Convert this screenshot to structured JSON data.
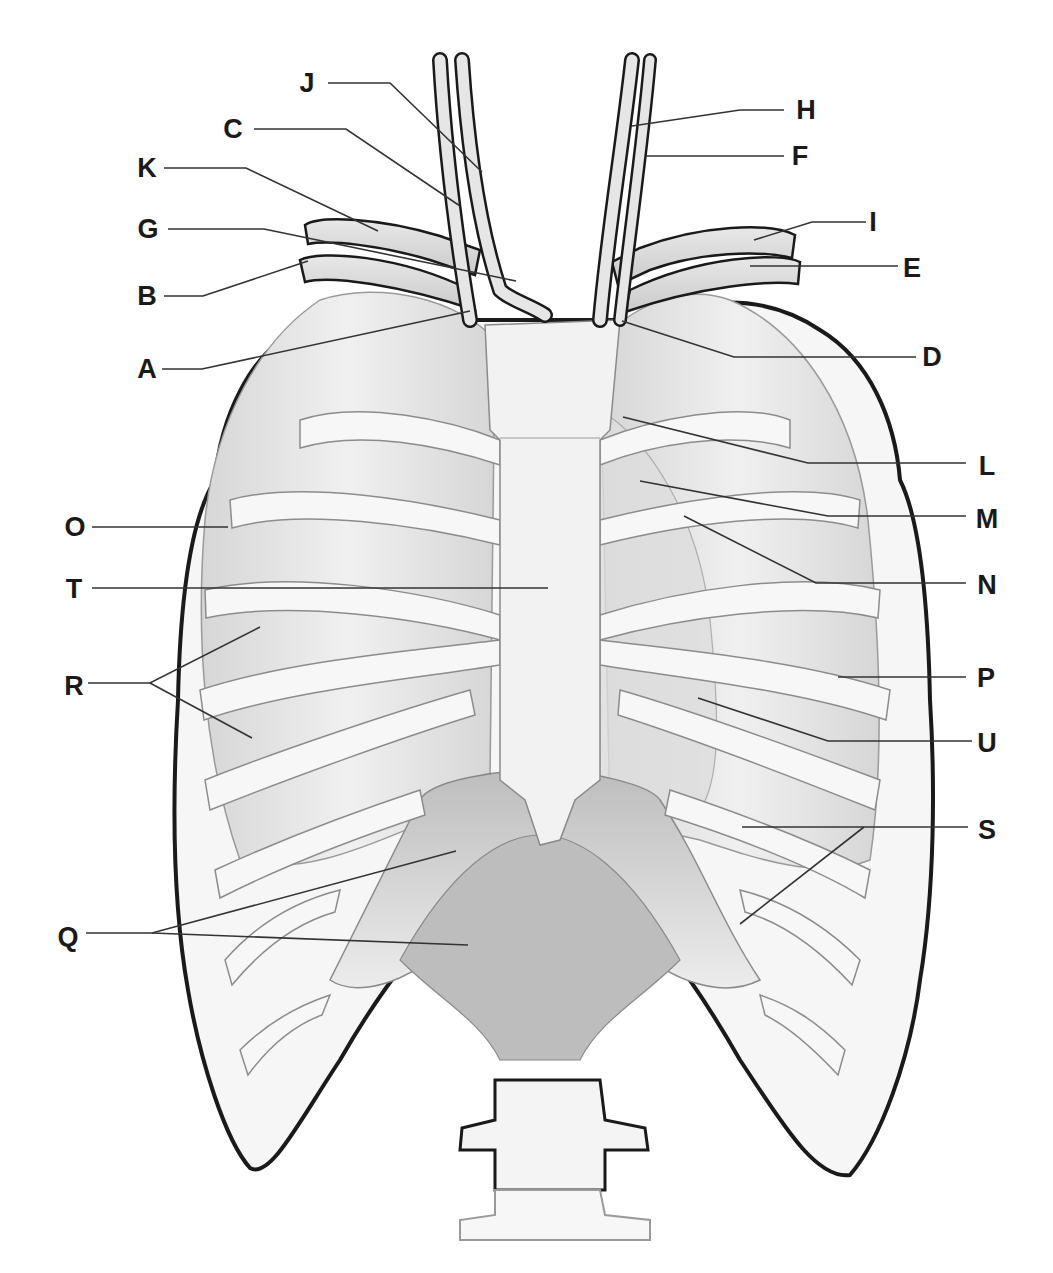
{
  "figure": {
    "colors": {
      "outline": "#1a1a1a",
      "bone": "#f4f4f4",
      "lung": "#e4e4e4",
      "muscle": "#cfcfcf",
      "leader": "#333333"
    }
  },
  "labels": [
    {
      "id": "J",
      "text": "J",
      "x": 307,
      "y": 83,
      "leader": [
        [
          328,
          83
        ],
        [
          390,
          83
        ],
        [
          482,
          172
        ]
      ]
    },
    {
      "id": "C",
      "text": "C",
      "x": 233,
      "y": 129,
      "leader": [
        [
          254,
          129
        ],
        [
          346,
          129
        ],
        [
          460,
          206
        ]
      ]
    },
    {
      "id": "K",
      "text": "K",
      "x": 147,
      "y": 168,
      "leader": [
        [
          164,
          168
        ],
        [
          246,
          168
        ],
        [
          378,
          231
        ]
      ]
    },
    {
      "id": "G",
      "text": "G",
      "x": 148,
      "y": 229,
      "leader": [
        [
          168,
          229
        ],
        [
          264,
          229
        ],
        [
          516,
          281
        ]
      ]
    },
    {
      "id": "B",
      "text": "B",
      "x": 147,
      "y": 296,
      "leader": [
        [
          164,
          296
        ],
        [
          203,
          296
        ],
        [
          308,
          261
        ]
      ]
    },
    {
      "id": "A",
      "text": "A",
      "x": 147,
      "y": 369,
      "leader": [
        [
          162,
          369
        ],
        [
          202,
          369
        ],
        [
          470,
          311
        ]
      ]
    },
    {
      "id": "H",
      "text": "H",
      "x": 806,
      "y": 110,
      "leader": [
        [
          784,
          110
        ],
        [
          740,
          110
        ],
        [
          632,
          126
        ]
      ]
    },
    {
      "id": "F",
      "text": "F",
      "x": 800,
      "y": 156,
      "leader": [
        [
          784,
          156
        ],
        [
          646,
          156
        ]
      ]
    },
    {
      "id": "I",
      "text": "I",
      "x": 873,
      "y": 222,
      "leader": [
        [
          866,
          222
        ],
        [
          812,
          222
        ],
        [
          754,
          240
        ]
      ]
    },
    {
      "id": "E",
      "text": "E",
      "x": 912,
      "y": 268,
      "leader": [
        [
          898,
          266
        ],
        [
          750,
          266
        ]
      ]
    },
    {
      "id": "D",
      "text": "D",
      "x": 932,
      "y": 357,
      "leader": [
        [
          916,
          357
        ],
        [
          734,
          357
        ],
        [
          622,
          321
        ]
      ]
    },
    {
      "id": "L",
      "text": "L",
      "x": 987,
      "y": 466,
      "leader": [
        [
          966,
          463
        ],
        [
          808,
          463
        ],
        [
          623,
          417
        ]
      ]
    },
    {
      "id": "M",
      "text": "M",
      "x": 987,
      "y": 519,
      "leader": [
        [
          966,
          516
        ],
        [
          828,
          516
        ],
        [
          640,
          481
        ]
      ]
    },
    {
      "id": "N",
      "text": "N",
      "x": 987,
      "y": 585,
      "leader": [
        [
          966,
          583
        ],
        [
          816,
          583
        ],
        [
          684,
          516
        ]
      ]
    },
    {
      "id": "O",
      "text": "O",
      "x": 75,
      "y": 527,
      "leader": [
        [
          92,
          527
        ],
        [
          228,
          527
        ]
      ]
    },
    {
      "id": "T",
      "text": "T",
      "x": 74,
      "y": 589,
      "leader": [
        [
          92,
          588
        ],
        [
          548,
          588
        ]
      ]
    },
    {
      "id": "R",
      "text": "R",
      "x": 74,
      "y": 686,
      "leader": [
        [
          88,
          683
        ],
        [
          150,
          683
        ],
        [
          260,
          627
        ]
      ],
      "leader2": [
        [
          150,
          683
        ],
        [
          252,
          738
        ]
      ]
    },
    {
      "id": "P",
      "text": "P",
      "x": 986,
      "y": 678,
      "leader": [
        [
          966,
          677
        ],
        [
          838,
          677
        ]
      ]
    },
    {
      "id": "U",
      "text": "U",
      "x": 987,
      "y": 743,
      "leader": [
        [
          972,
          741
        ],
        [
          828,
          741
        ],
        [
          698,
          698
        ]
      ]
    },
    {
      "id": "S",
      "text": "S",
      "x": 987,
      "y": 830,
      "leader": [
        [
          968,
          827
        ],
        [
          742,
          827
        ]
      ],
      "leader2": [
        [
          864,
          827
        ],
        [
          740,
          924
        ]
      ]
    },
    {
      "id": "Q",
      "text": "Q",
      "x": 68,
      "y": 937,
      "leader": [
        [
          86,
          933
        ],
        [
          152,
          933
        ],
        [
          456,
          851
        ]
      ],
      "leader2": [
        [
          152,
          933
        ],
        [
          468,
          945
        ]
      ]
    }
  ]
}
